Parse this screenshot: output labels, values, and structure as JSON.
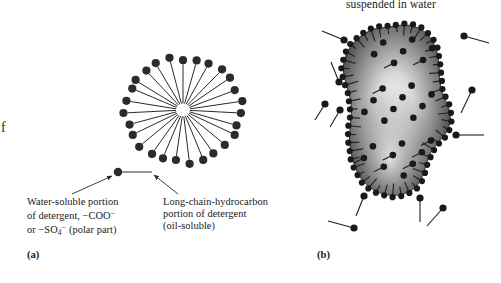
{
  "figure": {
    "width": 501,
    "height": 283,
    "background": "#ffffff",
    "ink_color": "#2b2b2b"
  },
  "top_label": {
    "text": "suspended in water",
    "note_visible": "partial line above is cropped off the top edge of the screenshot"
  },
  "edge_artifact": {
    "text": "f"
  },
  "panel_a": {
    "label": "(a)",
    "subject": "detergent micelle",
    "structure": {
      "center_x": 183,
      "center_y": 110,
      "spokes": 27,
      "tail_length": 46,
      "head_radius": 4.1,
      "radius_x": 58,
      "radius_y": 52
    },
    "sample_molecule": {
      "head_x": 118,
      "head_y": 172,
      "tail_end_x": 152,
      "tail_end_y": 172,
      "head_radius": 4.3
    },
    "callouts": [
      {
        "name": "water-soluble-portion",
        "lines": [
          "Water-soluble portion",
          "of detergent, −COO",
          "or −SO (polar part)"
        ],
        "line2_sup": "−",
        "line3_sub": "4",
        "line3_sup": "−",
        "leader": {
          "x1": 72,
          "y1": 194,
          "x2": 112,
          "y2": 176
        }
      },
      {
        "name": "long-chain-hydrocarbon-portion",
        "lines": [
          "Long-chain-hydrocarbon",
          "portion of detergent",
          "(oil-soluble)"
        ],
        "leader": {
          "x1": 178,
          "y1": 194,
          "x2": 154,
          "y2": 175
        }
      }
    ]
  },
  "panel_b": {
    "label": "(b)",
    "subject": "oil droplet suspended in water with detergent molecules at the surface",
    "droplet": {
      "outline": "M 396 26 C 412 22 428 30 434 44 C 441 58 438 74 441 88 C 444 101 452 108 450 122 C 448 136 436 142 430 154 C 424 167 424 182 412 190 C 398 199 380 196 368 186 C 356 176 352 160 350 146 C 348 131 353 117 351 103 C 349 88 341 76 344 62 C 347 46 360 34 374 29 Z",
      "gradient": {
        "highlight": "#f2f2f2",
        "mid": "#8a8a8a",
        "edge": "#3c3c3c"
      },
      "perimeter_molecules": 54,
      "interior_dots": 26
    },
    "free_molecules": [
      {
        "head_x": 344,
        "head_y": 40,
        "tail_x": 322,
        "tail_y": 31
      },
      {
        "head_x": 339,
        "head_y": 82,
        "tail_x": 331,
        "tail_y": 62
      },
      {
        "head_x": 325,
        "head_y": 104,
        "tail_x": 315,
        "tail_y": 120
      },
      {
        "head_x": 340,
        "head_y": 110,
        "tail_x": 330,
        "tail_y": 127
      },
      {
        "head_x": 464,
        "height_note": "right upper",
        "head_y": 36,
        "tail_x": 489,
        "tail_y": 43
      },
      {
        "head_x": 472,
        "head_y": 90,
        "tail_x": 461,
        "tail_y": 113
      },
      {
        "head_x": 456,
        "head_y": 135,
        "tail_x": 484,
        "tail_y": 135
      },
      {
        "head_x": 364,
        "head_y": 196,
        "tail_x": 356,
        "tail_y": 216
      },
      {
        "head_x": 354,
        "head_y": 228,
        "tail_x": 328,
        "tail_y": 221
      },
      {
        "head_x": 420,
        "head_y": 198,
        "tail_x": 420,
        "tail_y": 222
      },
      {
        "head_x": 443,
        "head_y": 208,
        "tail_x": 427,
        "tail_y": 226
      }
    ]
  }
}
